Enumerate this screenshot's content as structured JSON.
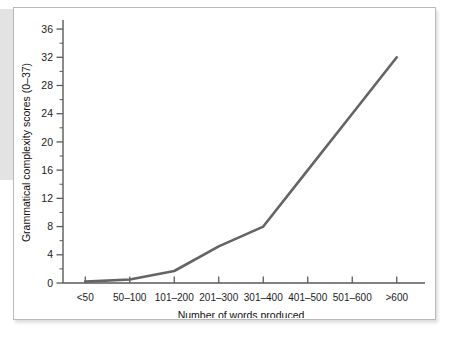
{
  "figure": {
    "background_color": "#ffffff",
    "frame_color": "#b9b9b9",
    "line_color": "#646464",
    "axis_color": "#595959"
  },
  "chart_data": {
    "type": "line",
    "title": "",
    "subtitle": "",
    "xlabel": "Number of words produced",
    "ylabel": "Grammatical complexity scores (0–37)",
    "categories": [
      "<50",
      "50–100",
      "101–200",
      "201–300",
      "301–400",
      "401–500",
      "501–600",
      ">600"
    ],
    "values": [
      0.2,
      0.5,
      1.7,
      5.2,
      8.0,
      16.0,
      24.0,
      32.0
    ],
    "series": [
      {
        "name": "Grammatical complexity",
        "values": [
          0.2,
          0.5,
          1.7,
          5.2,
          8.0,
          16.0,
          24.0,
          32.0
        ]
      }
    ],
    "ylim": [
      0,
      37
    ],
    "ytick_labels": [
      "0",
      "4",
      "8",
      "12",
      "16",
      "20",
      "24",
      "28",
      "32",
      "36"
    ],
    "ytick_values": [
      0,
      4,
      8,
      12,
      16,
      20,
      24,
      28,
      32,
      36
    ],
    "yminor_values": [
      2,
      6,
      10,
      14,
      18,
      22,
      26,
      30,
      34
    ],
    "grid": false,
    "legend": "none",
    "legend_position": "none"
  }
}
